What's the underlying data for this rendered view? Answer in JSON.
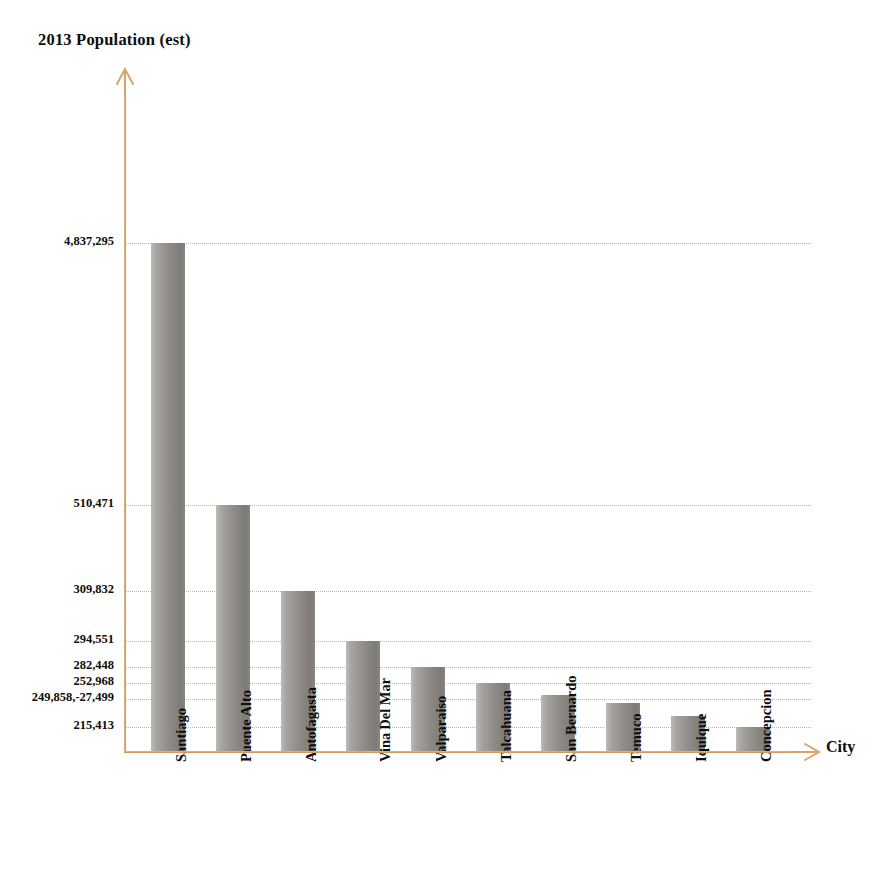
{
  "chart_data": {
    "type": "bar",
    "title": "2013 Population (est)",
    "xlabel": "City",
    "ylabel": "2013 Population (est)",
    "categories": [
      "Santiago",
      "Puente Alto",
      "Antofagasta",
      "Vina Del Mar",
      "Valparaiso",
      "Talcahuana",
      "San Bernardo",
      "Temuco",
      "Iquique",
      "Concepcion"
    ],
    "values": [
      4837295,
      510471,
      309832,
      294551,
      282448,
      252968,
      249858,
      227499,
      215413,
      200000
    ],
    "ytick_labels": [
      "4,837,295",
      "510,471",
      "309,832",
      "294,551",
      "282,448",
      "252,968",
      "249,858,-27,499",
      "215,413"
    ],
    "ytick_values": [
      4837295,
      510471,
      309832,
      294551,
      282448,
      252968,
      249858,
      215413
    ],
    "ylim": [
      0,
      5400000
    ],
    "grid": true,
    "legend": false,
    "bar_color": "#8e8b87",
    "axis_color": "#d8a46a",
    "gridline_color": "#c9a384"
  },
  "chart": {
    "title": "2013 Population (est)",
    "x_axis_title": "City",
    "y_ticks": [
      {
        "label": "4,837,295",
        "top": 243
      },
      {
        "label": "510,471",
        "top": 505
      },
      {
        "label": "309,832",
        "top": 591
      },
      {
        "label": "294,551",
        "top": 641
      },
      {
        "label": "282,448",
        "top": 667
      },
      {
        "label": "252,968",
        "top": 683
      },
      {
        "label": "249,858,-27,499",
        "top": 699
      },
      {
        "label": "215,413",
        "top": 727
      }
    ],
    "bars": [
      {
        "label": "Santiago",
        "label_lines": [
          "Santiago"
        ],
        "left": 151,
        "top": 243,
        "width": 34
      },
      {
        "label": "Puente Alto",
        "label_lines": [
          "Puente Alto"
        ],
        "left": 216,
        "top": 505,
        "width": 34
      },
      {
        "label": "Antofagasta",
        "label_lines": [
          "Antofagasta"
        ],
        "left": 281,
        "top": 591,
        "width": 34
      },
      {
        "label": "Vina Del Mar",
        "label_lines": [
          "Vina",
          "Del Mar"
        ],
        "left": 346,
        "top": 641,
        "width": 34
      },
      {
        "label": "Valparaiso",
        "label_lines": [
          "Valparaiso"
        ],
        "left": 411,
        "top": 667,
        "width": 34
      },
      {
        "label": "Talcahuana",
        "label_lines": [
          "Talcahuana"
        ],
        "left": 476,
        "top": 683,
        "width": 34
      },
      {
        "label": "San Bernardo",
        "label_lines": [
          "San Bernardo"
        ],
        "left": 541,
        "top": 695,
        "width": 34
      },
      {
        "label": "Temuco",
        "label_lines": [
          "Temuco"
        ],
        "left": 606,
        "top": 703,
        "width": 34
      },
      {
        "label": "Iquique",
        "label_lines": [
          "Iquique"
        ],
        "left": 671,
        "top": 716,
        "width": 34
      },
      {
        "label": "Concepcion",
        "label_lines": [
          "Concepcion"
        ],
        "left": 736,
        "top": 727,
        "width": 34
      }
    ],
    "geometry": {
      "axis_x": 124,
      "baseline_y": 751,
      "plot_right": 811
    }
  }
}
